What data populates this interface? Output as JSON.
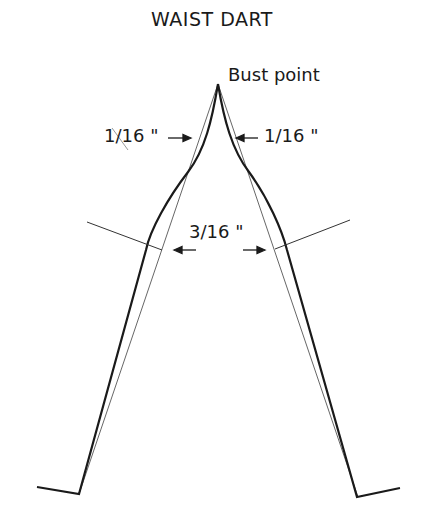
{
  "title": "WAIST DART",
  "labels": {
    "apex": "Bust point",
    "left_top": "1/16 \"",
    "right_top": "1/16 \"",
    "middle": "3/16 \""
  },
  "colors": {
    "line": "#1a1a1a",
    "guide": "#555555",
    "background": "#ffffff"
  }
}
